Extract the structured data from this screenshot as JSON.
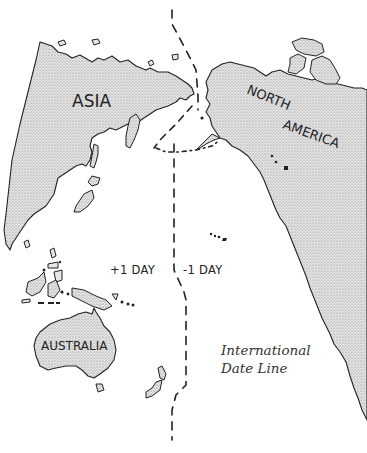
{
  "map": {
    "title_caption": {
      "line1": "International",
      "line2": "Date Line"
    },
    "regions": {
      "asia": "ASIA",
      "north_america_line1": "NORTH",
      "north_america_line2": "AMERICA",
      "australia": "AUSTRALIA"
    },
    "day_labels": {
      "west": "+1 DAY",
      "east": "-1 DAY"
    },
    "colors": {
      "land_fill": "#cfcfcf",
      "land_stroke": "#222222",
      "dateline": "#222222",
      "background": "#ffffff"
    }
  }
}
